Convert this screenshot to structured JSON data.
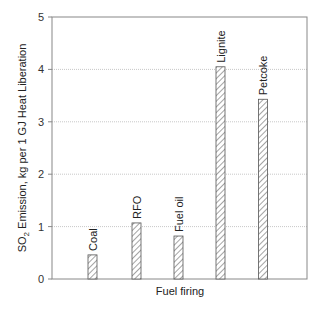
{
  "chart_data": {
    "type": "bar",
    "title": "",
    "xlabel": "Fuel firing",
    "ylabel": "SO2 Emission, kg per 1 GJ Heat Liberation",
    "ylabel_parts": {
      "pre": "SO",
      "sub": "2",
      "post": " Emission, kg per 1 GJ Heat Liberation"
    },
    "categories": [
      "Coal",
      "RFO",
      "Fuel oil",
      "Lignite",
      "Petcoke"
    ],
    "values": [
      0.46,
      1.07,
      0.82,
      4.05,
      3.43
    ],
    "ylim": [
      0,
      5
    ],
    "yticks": [
      0,
      1,
      2,
      3,
      4,
      5
    ],
    "grid": {
      "y": true,
      "style": "dotted",
      "color": "#c8c8c8"
    },
    "bar_style": {
      "fill": "hatched-diagonal",
      "stroke": "#555555"
    },
    "legend": null
  }
}
